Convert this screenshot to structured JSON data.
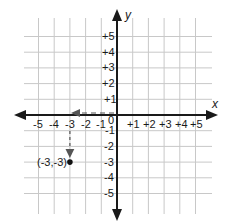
{
  "diagram": {
    "type": "coordinate-plane",
    "axes": {
      "x_label": "x",
      "y_label": "y",
      "x_ticks": [
        "-5",
        "-4",
        "-3",
        "-2",
        "-1",
        "+1",
        "+2",
        "+3",
        "+4",
        "+5"
      ],
      "y_ticks_positive": [
        "+5",
        "+4",
        "+3",
        "+2",
        "+1"
      ],
      "y_ticks_negative": [
        "-1",
        "-2",
        "-3",
        "-4",
        "-5"
      ],
      "origin_label": "0",
      "range": {
        "x": [
          -5,
          5
        ],
        "y": [
          -5,
          5
        ]
      }
    },
    "point": {
      "x": -3,
      "y": -3,
      "label": "(-3,-3)"
    },
    "path": [
      {
        "from": [
          0,
          0
        ],
        "to": [
          -3,
          0
        ],
        "style": "dashed-arrow",
        "direction": "left"
      },
      {
        "from": [
          -3,
          0
        ],
        "to": [
          -3,
          -3
        ],
        "style": "dashed-arrow",
        "direction": "down"
      }
    ],
    "colors": {
      "grid": "#c8c8c8",
      "axis": "#1a1a1a",
      "path": "#555555",
      "point": "#111111"
    }
  }
}
